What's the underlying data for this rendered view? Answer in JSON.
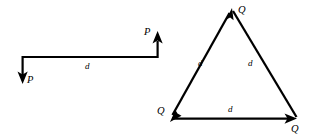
{
  "figure": {
    "background_color": "#ffffff",
    "stroke_color": "#000000",
    "couple_figure": {
      "name": "couple-of-forces-P",
      "force_label_left": "P",
      "force_label_right": "P",
      "distance_label": "d",
      "left_arrow_direction": "down",
      "right_arrow_direction": "up",
      "geometry": {
        "bar_y": 57,
        "bar_x_start": 22,
        "bar_x_end": 158,
        "down_arrow_tip_y": 84,
        "up_arrow_tip_y": 31
      }
    },
    "triangle_figure": {
      "name": "equilateral-force-triangle-Q",
      "vertex_labels": [
        "Q",
        "Q",
        "Q"
      ],
      "side_labels": [
        "d",
        "d",
        "d"
      ],
      "top_vertex_label": "Q",
      "bottom_left_vertex_label": "Q",
      "bottom_right_vertex_label": "Q",
      "left_side_label": "d",
      "right_side_label": "d",
      "bottom_side_label": "d",
      "arrow_directions": [
        "up-right-to-top-vertex",
        "down-left-to-bottom-left-vertex",
        "right-to-bottom-right-vertex"
      ],
      "geometry": {
        "top": [
          232,
          8
        ],
        "bottom_left": [
          170,
          119
        ],
        "bottom_right": [
          297,
          119
        ]
      }
    }
  }
}
